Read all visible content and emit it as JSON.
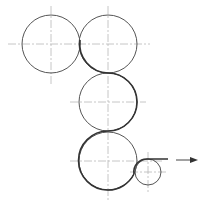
{
  "diagram": {
    "type": "roller-train-schematic",
    "colors": {
      "background": "#ffffff",
      "outline": "#555555",
      "web_path": "#222222",
      "centerline": "#b8b8b8"
    },
    "rollers": [
      {
        "id": "roller-1",
        "cx": 51,
        "cy": 44,
        "r": 29
      },
      {
        "id": "roller-2",
        "cx": 108,
        "cy": 44,
        "r": 29
      },
      {
        "id": "roller-3",
        "cx": 108,
        "cy": 102,
        "r": 29
      },
      {
        "id": "roller-4",
        "cx": 108,
        "cy": 161,
        "r": 29
      },
      {
        "id": "roller-5-small",
        "cx": 148,
        "cy": 172,
        "r": 13
      }
    ],
    "arrow": {
      "direction": "right",
      "x1": 176,
      "x2": 196,
      "y": 160
    }
  }
}
